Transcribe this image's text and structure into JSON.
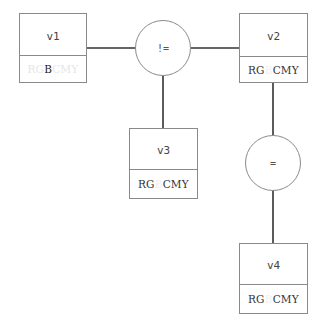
{
  "diagram": {
    "nodes": [
      {
        "id": "v1",
        "label": "v1",
        "colors": {
          "before": "RG",
          "highlight": "B",
          "after": "CMY"
        },
        "style": "only-B-active"
      },
      {
        "id": "v2",
        "label": "v2",
        "colors": {
          "before": "RG",
          "highlight": "B",
          "after": "CMY"
        },
        "style": "B-excluded"
      },
      {
        "id": "v3",
        "label": "v3",
        "colors": {
          "before": "RG",
          "highlight": "B",
          "after": "CMY"
        },
        "style": "B-excluded"
      },
      {
        "id": "v4",
        "label": "v4",
        "colors": {
          "before": "RG",
          "highlight": "B",
          "after": "CMY"
        },
        "style": "B-excluded"
      }
    ],
    "constraints": [
      {
        "id": "c1",
        "operator": "!=",
        "connects": [
          "v1",
          "v2",
          "v3"
        ]
      },
      {
        "id": "c2",
        "operator": "=",
        "connects": [
          "v2",
          "v4"
        ]
      }
    ],
    "colors": {
      "line": "#333333",
      "border": "#8a8a8a",
      "faded_text": "#e6e6e6"
    }
  }
}
